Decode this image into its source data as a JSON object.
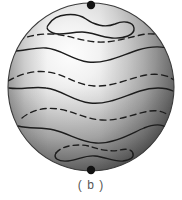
{
  "figure": {
    "caption": "( b )",
    "label": "b",
    "background_color": "#ffffff",
    "line_color": "#1a1a1a",
    "pole_dot_color": "#111111",
    "caption_color": "#565656",
    "sphere": {
      "center_x": 91,
      "center_y": 87,
      "radius_x": 83,
      "radius_y": 84,
      "shading": {
        "highlight_color": "#fbfbfb",
        "mid_color": "#d8d8d8",
        "shadow_color": "#6e6e6e",
        "edge_color": "#4a4a4a",
        "highlight_x_pct": 38,
        "highlight_y_pct": 30
      }
    },
    "pole_dots": [
      {
        "name": "north-pole-dot",
        "x": 91,
        "y": 5,
        "r": 4.2
      },
      {
        "name": "south-pole-dot",
        "x": 91,
        "y": 170,
        "r": 4.2
      }
    ],
    "curves": [
      {
        "name": "north-polar-loop",
        "style": "solid",
        "kind": "closed-loop"
      },
      {
        "name": "latitude-curve-1",
        "style": "dashed",
        "kind": "wavy-latitude"
      },
      {
        "name": "latitude-curve-2",
        "style": "solid",
        "kind": "wavy-latitude"
      },
      {
        "name": "latitude-curve-3",
        "style": "dashed",
        "kind": "wavy-latitude"
      },
      {
        "name": "latitude-curve-4",
        "style": "solid",
        "kind": "wavy-latitude"
      },
      {
        "name": "latitude-curve-5",
        "style": "dashed",
        "kind": "wavy-latitude"
      },
      {
        "name": "latitude-curve-6",
        "style": "solid",
        "kind": "wavy-latitude"
      },
      {
        "name": "south-polar-loop-dashed",
        "style": "dashed",
        "kind": "closed-loop-upper"
      },
      {
        "name": "south-polar-loop-solid",
        "style": "solid",
        "kind": "closed-loop-lower"
      }
    ]
  }
}
